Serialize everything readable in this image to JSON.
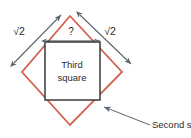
{
  "figure": {
    "colors": {
      "second_square_stroke": "#d2604f",
      "third_square_stroke": "#3a3a3a",
      "arrow_stroke": "#5a6570",
      "text": "#2b2b2b",
      "background": "#ffffff"
    },
    "labels": {
      "sqrt_left": "√2",
      "sqrt_right": "√2",
      "unknown": "?",
      "third_square_line1": "Third",
      "third_square_line2": "square",
      "second_square_callout": "Second square"
    },
    "shapes": {
      "second_square": {
        "name": "second-square",
        "kind": "rotated-square-diamond",
        "points": "70,16 122,72 70,125 22,72"
      },
      "third_square": {
        "name": "third-square",
        "kind": "axis-aligned-square",
        "x": 45,
        "y": 42,
        "width": 55,
        "height": 58
      }
    },
    "arrows": {
      "left_diagonal": {
        "x1": 14,
        "y1": 63,
        "x2": 61,
        "y2": 15
      },
      "right_diagonal": {
        "x1": 80,
        "y1": 15,
        "x2": 131,
        "y2": 64
      },
      "top_horizontal": {
        "x1": 46,
        "y1": 41,
        "x2": 100,
        "y2": 41
      },
      "callout_leader": {
        "x1": 150,
        "y1": 125,
        "x2": 103,
        "y2": 106
      }
    }
  }
}
